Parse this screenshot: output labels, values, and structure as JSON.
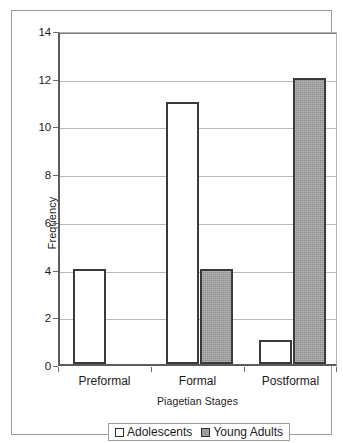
{
  "chart_data": {
    "type": "bar",
    "title": "",
    "xlabel": "Piagetian Stages",
    "ylabel": "Frequency",
    "categories": [
      "Preformal",
      "Formal",
      "Postformal"
    ],
    "series": [
      {
        "name": "Adolescents",
        "values": [
          4,
          11,
          1
        ],
        "color": "#ffffff"
      },
      {
        "name": "Young Adults",
        "values": [
          0,
          4,
          12
        ],
        "color": "#9d9d9d"
      }
    ],
    "ylim": [
      0,
      14
    ],
    "ytick_step": 2,
    "yticks": [
      0,
      2,
      4,
      6,
      8,
      10,
      12,
      14
    ],
    "ytick_labels": [
      "0",
      "2",
      "4",
      "6",
      "8",
      "10",
      "12",
      "14"
    ],
    "grid": true,
    "grid_axis": "y",
    "legend_position": "bottom",
    "bar_outline_color": "#3a3a3a",
    "grid_color": "#b8b8b8",
    "axis_color": "#5c5c5c"
  },
  "legend": {
    "items": [
      {
        "label": "Adolescents"
      },
      {
        "label": "Young Adults"
      }
    ]
  }
}
